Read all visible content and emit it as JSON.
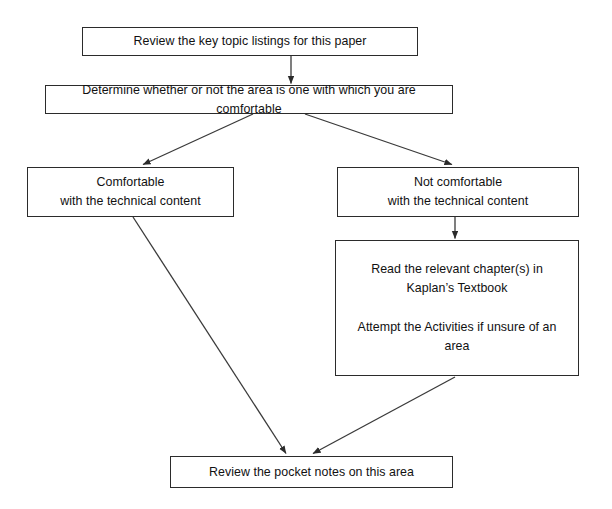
{
  "diagram": {
    "type": "flowchart",
    "nodes": [
      {
        "id": "review-key-topics",
        "label": "Review the key topic listings for this paper"
      },
      {
        "id": "determine-comfort",
        "label": "Determine whether or not the area is one with which you are comfortable"
      },
      {
        "id": "comfortable",
        "label": "Comfortable\nwith the technical content"
      },
      {
        "id": "not-comfortable",
        "label": "Not comfortable\nwith the technical content"
      },
      {
        "id": "read-textbook",
        "label": "Read the relevant chapter(s) in\nKaplan’s Textbook\n\nAttempt the Activities if unsure of an\narea"
      },
      {
        "id": "review-pocket-notes",
        "label": "Review the pocket notes on this area"
      }
    ],
    "edges": [
      {
        "id": "edge-1",
        "from": "review-key-topics",
        "to": "determine-comfort",
        "style": "vertical-arrow"
      },
      {
        "id": "edge-2",
        "from": "determine-comfort",
        "to": "comfortable",
        "style": "diagonal-arrow-left"
      },
      {
        "id": "edge-3",
        "from": "determine-comfort",
        "to": "not-comfortable",
        "style": "diagonal-arrow-right"
      },
      {
        "id": "edge-4",
        "from": "not-comfortable",
        "to": "read-textbook",
        "style": "vertical-arrow"
      },
      {
        "id": "edge-5",
        "from": "comfortable",
        "to": "review-pocket-notes",
        "style": "diagonal-arrow-down-right"
      },
      {
        "id": "edge-6",
        "from": "read-textbook",
        "to": "review-pocket-notes",
        "style": "diagonal-arrow-down-left"
      }
    ],
    "colors": {
      "box_border": "#2b2b2b",
      "box_fill": "#ffffff",
      "connector": "#3a3a3a",
      "text": "#111111",
      "background": "#ffffff"
    }
  }
}
